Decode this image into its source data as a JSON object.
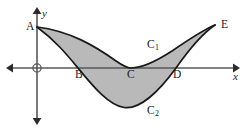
{
  "figure": {
    "background_color": "#ffffff",
    "shade_color": "#b9b9b9",
    "curve_color": "#1a1a1a",
    "axis_color": "#58585a",
    "width": 251,
    "height": 129
  },
  "axes": {
    "x_label": "x",
    "y_label": "y",
    "origin_label": "",
    "x_axis_y_px": 68,
    "y_axis_x_px": 37,
    "x_axis_start_px": 8,
    "x_axis_end_px": 238,
    "y_axis_start_px": 10,
    "y_axis_end_px": 122,
    "arrowheads": "both-ends-both-axes",
    "grid": false
  },
  "points": [
    {
      "id": "A",
      "label": "A",
      "x_px": 37,
      "y_px": 27,
      "note": "common start of both curves on the y-axis"
    },
    {
      "id": "B",
      "label": "B",
      "x_px": 78,
      "y_px": 68,
      "note": "C2 crosses the x-axis"
    },
    {
      "id": "C",
      "label": "C",
      "x_px": 130,
      "y_px": 68,
      "note": "C1 touches the x-axis"
    },
    {
      "id": "D",
      "label": "D",
      "x_px": 176,
      "y_px": 68,
      "note": "C2 crosses the x-axis"
    },
    {
      "id": "E",
      "label": "E",
      "x_px": 215,
      "y_px": 25,
      "note": "common end of both curves"
    }
  ],
  "curves": [
    {
      "id": "C1",
      "label": "C",
      "sub": "1",
      "label_x_px": 147,
      "label_y_px": 39,
      "description": "upper curve from A to E, minimum touching the x-axis at C",
      "path": "M 37,27 C 70,31 95,46 116,61 C 124,66.5 128,68 131,68 C 140,68 155,62 172,51 C 188,40 203,30 215,25"
    },
    {
      "id": "C2",
      "label": "C",
      "sub": "2",
      "label_x_px": 147,
      "label_y_px": 105,
      "description": "lower curve from A to E, crossing the x-axis at B and D, minimum near x = 125",
      "path": "M 37,27 C 56,41 68,56 78,68 C 92,85 108,105 124,107.5 C 140,110 160,90 176,68 C 188,51 203,33 215,25"
    }
  ],
  "region": {
    "id": "shaded-region",
    "description": "area enclosed between curve C1 and curve C2 from A to E",
    "fill": "#b9b9b9",
    "path": "M 37,27 C 70,31 95,46 116,61 C 124,66.5 128,68 131,68 C 140,68 155,62 172,51 C 188,40 203,30 215,25 C 203,33 188,51 176,68 C 160,90 140,110 124,107.5 C 108,105 92,85 78,68 C 68,56 56,41 37,27 Z"
  },
  "labels": {
    "A": "A",
    "B": "B",
    "C": "C",
    "D": "D",
    "E": "E",
    "x": "x",
    "y": "y",
    "c1_base": "C",
    "c1_sub": "1",
    "c2_base": "C",
    "c2_sub": "2"
  }
}
